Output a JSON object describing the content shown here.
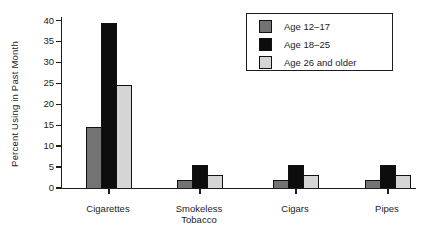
{
  "figure": {
    "ylabel": "Percent Using in Past Month"
  },
  "chart_data": {
    "type": "bar",
    "title": "",
    "xlabel": "",
    "ylabel": "Percent Using in Past Month",
    "categories": [
      "Cigarettes",
      "Smokeless Tobacco",
      "Cigars",
      "Pipes"
    ],
    "series": [
      {
        "name": "Age 12–17",
        "color": "#737373",
        "values": [
          14.5,
          2,
          2,
          2
        ]
      },
      {
        "name": "Age 18–25",
        "color": "#0d0d0d",
        "values": [
          39.5,
          5.5,
          5.5,
          5.5
        ]
      },
      {
        "name": "Age 26 and older",
        "color": "#d5d5d5",
        "values": [
          24.5,
          3,
          3,
          3
        ]
      }
    ],
    "ylim": [
      0,
      40
    ],
    "yticks": [
      0,
      5,
      10,
      15,
      20,
      25,
      30,
      35,
      40
    ],
    "grid": false,
    "legend_position": "upper right"
  }
}
